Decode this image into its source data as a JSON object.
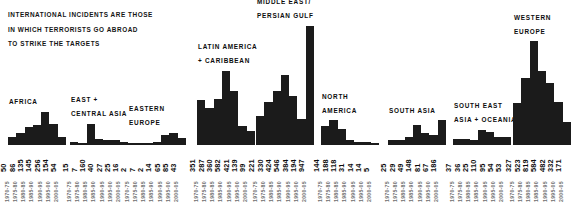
{
  "caption": {
    "lines": [
      "INTERNATIONAL INCIDENTS ARE THOSE",
      "IN WHICH TERRORISTS GO ABROAD",
      "TO STRIKE THE TARGETS"
    ]
  },
  "chart_data": {
    "type": "bar",
    "title": "",
    "xlabel": "",
    "ylabel": "",
    "grid": false,
    "legend": "none",
    "categories": [
      "1970-75",
      "1975-80",
      "1980-85",
      "1985-90",
      "1990-95",
      "1995-00",
      "2000-05"
    ],
    "ylim": [
      0,
      947
    ],
    "series": [
      {
        "name": "AFRICA",
        "title_lines": [
          "AFRICA"
        ],
        "values": [
          50,
          86,
          135,
          145,
          256,
          154,
          54
        ]
      },
      {
        "name": "EAST + CENTRAL ASIA",
        "title_lines": [
          "EAST +",
          "CENTRAL ASIA"
        ],
        "values": [
          15,
          7,
          160,
          40,
          27,
          25,
          16
        ]
      },
      {
        "name": "EASTERN EUROPE",
        "title_lines": [
          "EASTERN",
          "EUROPE"
        ],
        "values": [
          2,
          7,
          2,
          14,
          65,
          85,
          43
        ]
      },
      {
        "name": "LATIN AMERICA + CARIBBEAN",
        "title_lines": [
          "LATIN AMERICA",
          "+ CARIBBEAN"
        ],
        "values": [
          351,
          287,
          360,
          582,
          421,
          139,
          99
        ]
      },
      {
        "name": "MIDDLE EAST / PERSIAN GULF",
        "title_lines": [
          "MIDDLE EAST/",
          "PERSIAN GULF"
        ],
        "values": [
          221,
          330,
          424,
          546,
          384,
          194,
          947
        ]
      },
      {
        "name": "NORTH AMERICA",
        "title_lines": [
          "NORTH",
          "AMERICA"
        ],
        "values": [
          144,
          188,
          118,
          31,
          14,
          14,
          5
        ]
      },
      {
        "name": "SOUTH ASIA",
        "title_lines": [
          "SOUTH ASIA"
        ],
        "values": [
          25,
          29,
          49,
          148,
          81,
          67,
          186
        ]
      },
      {
        "name": "SOUTH EAST ASIA + OCEANIA",
        "title_lines": [
          "SOUTH EAST",
          "ASIA + OCEANIA"
        ],
        "values": [
          37,
          36,
          25,
          110,
          95,
          54,
          53
        ]
      },
      {
        "name": "WESTERN EUROPE",
        "title_lines": [
          "WESTERN",
          "EUROPE"
        ],
        "values": [
          327,
          523,
          819,
          584,
          482,
          332,
          171
        ]
      }
    ]
  },
  "colors": {
    "bar": "#1b1b1b",
    "text": "#0d0d0d",
    "year_text": "#6e6e6e",
    "background": "#ffffff"
  },
  "layout": {
    "panel_lefts": [
      8,
      70,
      128,
      197,
      256,
      321,
      388,
      453,
      513
    ],
    "panel_widths": [
      58,
      58,
      58,
      58,
      58,
      58,
      58,
      58,
      58
    ],
    "bar_bottom": 63,
    "max_bar_height": 118,
    "value_row_top": 142,
    "year_row_top": 170
  }
}
